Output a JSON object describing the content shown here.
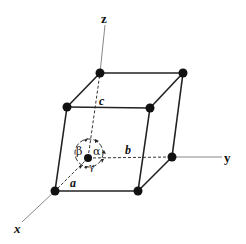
{
  "diagram": {
    "axes": {
      "x": {
        "label": "x"
      },
      "y": {
        "label": "y"
      },
      "z": {
        "label": "z"
      }
    },
    "edges": {
      "a": {
        "label": "a"
      },
      "b": {
        "label": "b"
      },
      "c": {
        "label": "c"
      }
    },
    "angles": {
      "alpha": {
        "label": "α"
      },
      "beta": {
        "label": "β"
      },
      "gamma": {
        "label": "γ"
      }
    },
    "colors": {
      "line": "#222222",
      "axis": "#888888",
      "atom": "#111111",
      "background": "#ffffff"
    }
  }
}
